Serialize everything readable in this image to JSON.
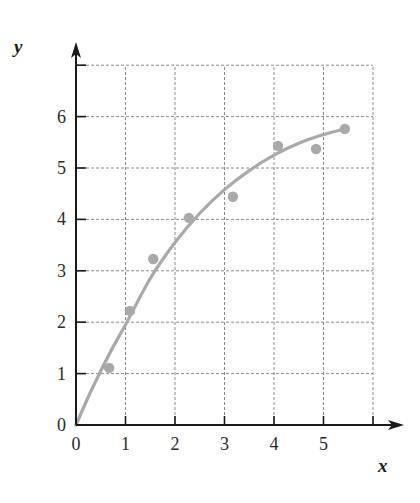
{
  "chart_data": {
    "type": "scatter",
    "title": "",
    "xlabel": "x",
    "ylabel": "y",
    "xlim": [
      0,
      6
    ],
    "ylim": [
      0,
      7
    ],
    "grid": true,
    "x_ticks": [
      0,
      1,
      2,
      3,
      4,
      5
    ],
    "y_ticks": [
      0,
      1,
      2,
      3,
      4,
      5,
      6
    ],
    "legend": null,
    "series": [
      {
        "name": "data points",
        "kind": "scatter",
        "color": "#a9a9a9",
        "x": [
          0.67,
          1.09,
          1.56,
          2.28,
          3.17,
          4.08,
          4.85,
          5.43
        ],
        "y": [
          1.11,
          2.22,
          3.23,
          4.03,
          4.44,
          5.43,
          5.37,
          5.76
        ]
      },
      {
        "name": "fitted curve",
        "kind": "line",
        "color": "#a9a9a9",
        "x": [
          0,
          0.25,
          0.5,
          0.75,
          1.0,
          1.5,
          2.0,
          2.5,
          3.0,
          3.5,
          4.0,
          4.5,
          5.0,
          5.43
        ],
        "y": [
          0,
          0.55,
          1.05,
          1.52,
          1.95,
          2.85,
          3.55,
          4.12,
          4.58,
          4.95,
          5.25,
          5.48,
          5.65,
          5.76
        ]
      }
    ]
  },
  "colors": {
    "axis": "#1a1a1a",
    "grid": "#8a8a8a",
    "series": "#a9a9a9"
  }
}
